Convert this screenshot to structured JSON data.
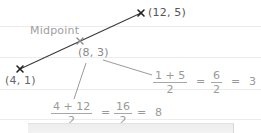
{
  "diagram": {
    "title": "Midpoint",
    "colors": {
      "segment": "#333333",
      "endpoint_marker": "#222222",
      "midpoint_marker": "#8a8a8a",
      "text_dark": "#555555",
      "text_light": "#9a9a9a",
      "rule_line": "#ececec"
    },
    "points": {
      "start": {
        "label": "(4, 1)",
        "x": 4,
        "y": 1
      },
      "end": {
        "label": "(12, 5)",
        "x": 12,
        "y": 5
      },
      "midpoint": {
        "label": "(8, 3)",
        "x": 8,
        "y": 3,
        "caption": "Midpoint"
      }
    },
    "calculations": {
      "y_coord": {
        "numerator": "1 + 5",
        "denominator": "2",
        "eq1": "=",
        "mid_numerator": "6",
        "mid_denominator": "2",
        "eq2": "=",
        "result": "3"
      },
      "x_coord": {
        "numerator": "4 + 12",
        "denominator": "2",
        "eq1": "=",
        "mid_numerator": "16",
        "mid_denominator": "2",
        "eq2": "=",
        "result": "8"
      }
    }
  }
}
